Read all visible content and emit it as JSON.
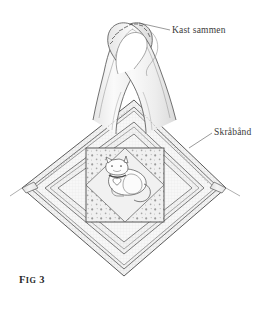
{
  "figure": {
    "caption_prefix": "F",
    "caption_small": "IG",
    "caption_number": "3",
    "caption_full": "Fig 3"
  },
  "labels": [
    {
      "id": "kast-sammen",
      "text": "Kast sammen",
      "meaning": "whip stitch together",
      "leader_from": [
        170,
        30
      ],
      "leader_to": [
        139,
        23
      ]
    },
    {
      "id": "skraaband",
      "text": "Skråbånd",
      "meaning": "bias tape",
      "leader_from": [
        212,
        132
      ],
      "leader_to": [
        189,
        147
      ]
    }
  ],
  "colors": {
    "outline": "#4a4a4a",
    "outline_soft": "#6e6e6e",
    "fabric_fill": "#efefef",
    "fabric_fill_light": "#f6f6f6",
    "binding_fill": "#e8e8e8",
    "dot_color": "#8c8c8c",
    "grid_color": "#cfcfcf",
    "cat_fill": "#fdfdfd",
    "label_text": "#3a3a3a",
    "caption_text": "#2b2b2b",
    "background": "#ffffff"
  },
  "geometry": {
    "diamond_center": [
      124,
      188
    ],
    "diamond_top": [
      134,
      100
    ],
    "diamond_left": [
      22,
      188
    ],
    "diamond_right": [
      226,
      188
    ],
    "diamond_bottom": [
      124,
      276
    ],
    "center_panel": {
      "x": 86,
      "y": 148,
      "width": 78,
      "height": 74
    }
  },
  "parts": {
    "hanging_loop": "crossed bias tape loop stitched at top",
    "binding_rows": 3,
    "center_motif": "white cat with collar and heart pendant",
    "center_background": "dotted fabric with plain rotated diamond",
    "thread_tail": "loose thread end curling from whip stitched loop"
  }
}
